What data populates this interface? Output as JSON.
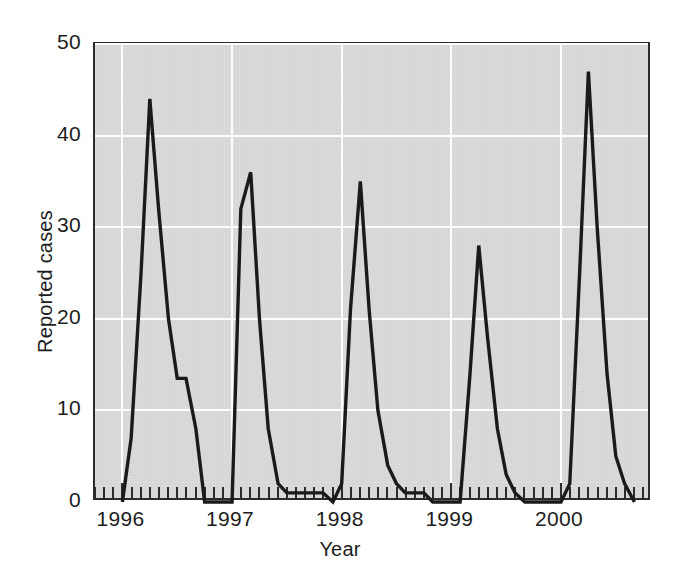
{
  "chart_data": {
    "type": "line",
    "title": "",
    "xlabel": "Year",
    "ylabel": "Reported cases",
    "xlim": [
      1995.75,
      2000.83
    ],
    "ylim": [
      0,
      50
    ],
    "grid": true,
    "legend": null,
    "yticks": [
      0,
      10,
      20,
      30,
      40,
      50
    ],
    "ytick_labels": [
      "0",
      "10",
      "20",
      "30",
      "40",
      "50"
    ],
    "xticks": [
      1996,
      1997,
      1998,
      1999,
      2000
    ],
    "xtick_labels": [
      "1996",
      "1997",
      "1998",
      "1999",
      "2000"
    ],
    "minor_xticks": "monthly",
    "series": [
      {
        "name": "Reported cases",
        "color": "#1a1a1a",
        "x": [
          1996.0,
          1996.08,
          1996.17,
          1996.25,
          1996.33,
          1996.42,
          1996.5,
          1996.58,
          1996.67,
          1996.75,
          1996.83,
          1996.92,
          1997.0,
          1997.08,
          1997.17,
          1997.25,
          1997.33,
          1997.42,
          1997.5,
          1997.58,
          1997.67,
          1997.75,
          1997.83,
          1997.92,
          1998.0,
          1998.08,
          1998.17,
          1998.25,
          1998.33,
          1998.42,
          1998.5,
          1998.58,
          1998.67,
          1998.75,
          1998.83,
          1998.92,
          1999.0,
          1999.08,
          1999.17,
          1999.25,
          1999.33,
          1999.42,
          1999.5,
          1999.58,
          1999.67,
          1999.75,
          1999.83,
          1999.92,
          2000.0,
          2000.08,
          2000.17,
          2000.25,
          2000.33,
          2000.42,
          2000.5,
          2000.58,
          2000.67
        ],
        "y": [
          0,
          7,
          25,
          44,
          32,
          20,
          13.5,
          13.5,
          8,
          0,
          0,
          0,
          0,
          32,
          36,
          20,
          8,
          2,
          1,
          1,
          1,
          1,
          1,
          0,
          2,
          21,
          35,
          21,
          10,
          4,
          2,
          1,
          1,
          1,
          0,
          0,
          0,
          0,
          14,
          28,
          18,
          8,
          3,
          1,
          0,
          0,
          0,
          0,
          0,
          2,
          25,
          47,
          30,
          14,
          5,
          2,
          0
        ]
      }
    ]
  },
  "axis": {
    "y_title": "Reported cases",
    "x_title": "Year"
  }
}
